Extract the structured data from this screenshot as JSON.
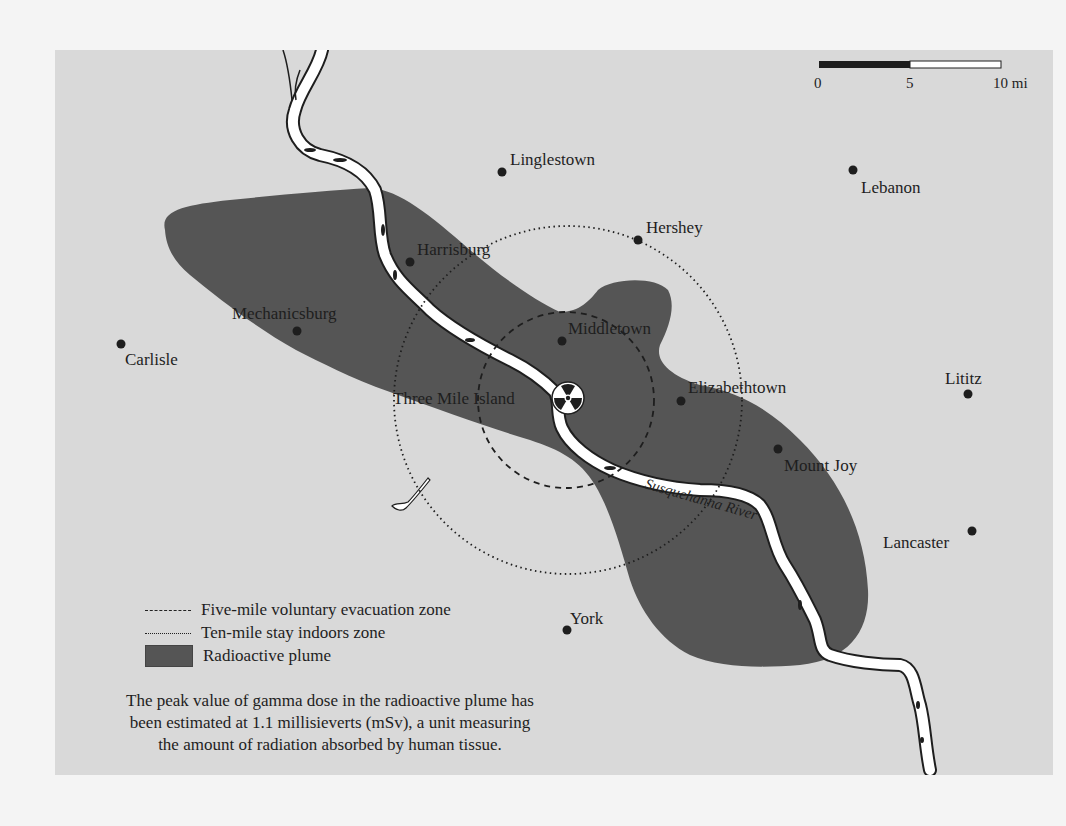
{
  "map": {
    "scale_bar": {
      "ticks": [
        "0",
        "5",
        "10 mi"
      ]
    },
    "towns": [
      {
        "name": "Linglestown",
        "dot": [
          502,
          172
        ],
        "label": [
          510,
          165
        ]
      },
      {
        "name": "Lebanon",
        "dot": [
          853,
          170
        ],
        "label": [
          861,
          193
        ]
      },
      {
        "name": "Hershey",
        "dot": [
          638,
          240
        ],
        "label": [
          646,
          233
        ]
      },
      {
        "name": "Harrisburg",
        "dot": [
          410,
          262
        ],
        "label": [
          417,
          255
        ]
      },
      {
        "name": "Mechanicsburg",
        "dot": [
          297,
          331
        ],
        "label": [
          232,
          319
        ]
      },
      {
        "name": "Carlisle",
        "dot": [
          121,
          344
        ],
        "label": [
          125,
          365
        ]
      },
      {
        "name": "Middletown",
        "dot": [
          562,
          341
        ],
        "label": [
          568,
          334
        ]
      },
      {
        "name": "Elizabethtown",
        "dot": [
          681,
          401
        ],
        "label": [
          688,
          393
        ]
      },
      {
        "name": "Lititz",
        "dot": [
          968,
          394
        ],
        "label": [
          945,
          384
        ]
      },
      {
        "name": "Mount Joy",
        "dot": [
          778,
          449
        ],
        "label": [
          784,
          471
        ]
      },
      {
        "name": "Lancaster",
        "dot": [
          972,
          531
        ],
        "label": [
          883,
          548
        ]
      },
      {
        "name": "York",
        "dot": [
          567,
          630
        ],
        "label": [
          570,
          624
        ]
      }
    ],
    "site": {
      "name": "Three Mile Island",
      "icon": "radiation-trefoil-icon",
      "center": [
        568,
        398
      ],
      "label": [
        393,
        404
      ]
    },
    "river_label": "Susquehanna River",
    "zones": {
      "five_mile": {
        "center": [
          566,
          400
        ],
        "radius": 88
      },
      "ten_mile": {
        "center": [
          568,
          400
        ],
        "radius": 174
      }
    },
    "colors": {
      "background": "#d9d9d9",
      "plume": "#555555",
      "river": "#ffffff",
      "ink": "#1e1e1e"
    }
  },
  "legend": {
    "items": [
      {
        "symbol": "dashed-line",
        "label": "Five-mile voluntary evacuation zone"
      },
      {
        "symbol": "dotted-line",
        "label": "Ten-mile stay indoors zone"
      },
      {
        "symbol": "plume-swatch",
        "label": "Radioactive plume"
      }
    ]
  },
  "caption": {
    "lines": [
      "The peak value of gamma dose in the radioactive plume has",
      "been estimated at 1.1 millisieverts (mSv), a unit measuring",
      "the amount of radiation absorbed by human tissue."
    ]
  }
}
